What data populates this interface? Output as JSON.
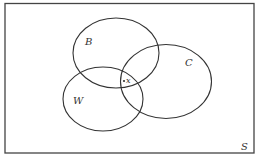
{
  "diagram": {
    "type": "venn",
    "universe": {
      "label": "S"
    },
    "sets": [
      {
        "id": "B",
        "label": "B"
      },
      {
        "id": "C",
        "label": "C"
      },
      {
        "id": "W",
        "label": "W"
      }
    ],
    "point": {
      "label": "x",
      "region": "B ∩ C ∩ W"
    },
    "colors": {
      "stroke": "#333333",
      "background": "#ffffff"
    }
  }
}
